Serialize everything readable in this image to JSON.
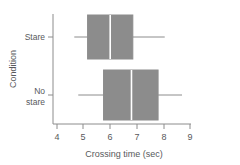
{
  "chart_data": {
    "type": "box",
    "title": "",
    "xlabel": "Crossing time (sec)",
    "ylabel": "Condition",
    "orientation": "horizontal",
    "xlim": [
      3.85,
      9.0
    ],
    "xticks": [
      4,
      5,
      6,
      7,
      8,
      9
    ],
    "xtick_labels": [
      "4",
      "5",
      "6",
      "7",
      "8",
      "9"
    ],
    "grid": false,
    "legend": "none",
    "categories": [
      "Stare",
      "No stare"
    ],
    "boxes": [
      {
        "category": "Stare",
        "label_lines": [
          "Stare"
        ],
        "min": 4.65,
        "q1": 5.15,
        "median": 6.0,
        "q3": 6.85,
        "max": 8.05
      },
      {
        "category": "No stare",
        "label_lines": [
          "No",
          "stare"
        ],
        "min": 4.8,
        "q1": 5.75,
        "median": 6.8,
        "q3": 7.8,
        "max": 8.7
      }
    ],
    "colors": {
      "box_fill": "#8c8c8c",
      "box_line": "#8c8c8c",
      "median_line": "#ffffff",
      "whisker": "#8c8c8c",
      "axis": "#8c8c8c",
      "text": "#58595b",
      "background": "#ffffff"
    }
  }
}
